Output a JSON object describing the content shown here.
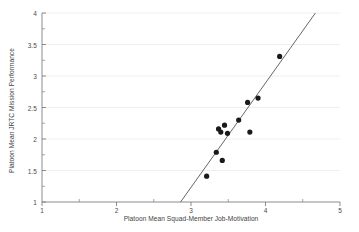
{
  "chart_data": {
    "type": "scatter",
    "title": "",
    "xlabel": "Platoon Mean Squad-Member Job-Motivation",
    "ylabel": "Platoon Mean JRTC Mission Performance",
    "xlim": [
      1,
      5
    ],
    "ylim": [
      1,
      4
    ],
    "xticks": [
      1,
      2,
      3,
      4,
      5
    ],
    "xtick_labels": [
      "1",
      "2",
      "3",
      "4",
      "5"
    ],
    "yticks": [
      1,
      1.5,
      2,
      2.5,
      3,
      3.5,
      4
    ],
    "ytick_labels": [
      "1",
      "1.5",
      "2",
      "2.5",
      "3",
      "3.5",
      "4"
    ],
    "x_minor_ticks": [
      1.5,
      2.5,
      3.5,
      4.5
    ],
    "y_minor_ticks": [
      1.25,
      1.75,
      2.25,
      2.75,
      3.25,
      3.75
    ],
    "grid": "horizontal-major-faint",
    "legend": null,
    "marker": "filled-circle",
    "marker_color": "#1a1a1a",
    "marker_size": 3.4,
    "line_color": "#555555",
    "axis_color": "#808080",
    "grid_color": "#e8e8e8",
    "points": [
      {
        "x": 3.21,
        "y": 1.41
      },
      {
        "x": 3.34,
        "y": 1.79
      },
      {
        "x": 3.42,
        "y": 1.66
      },
      {
        "x": 3.37,
        "y": 2.16
      },
      {
        "x": 3.45,
        "y": 2.22
      },
      {
        "x": 3.4,
        "y": 2.11
      },
      {
        "x": 3.49,
        "y": 2.09
      },
      {
        "x": 3.64,
        "y": 2.3
      },
      {
        "x": 3.76,
        "y": 2.58
      },
      {
        "x": 3.79,
        "y": 2.11
      },
      {
        "x": 3.9,
        "y": 2.65
      },
      {
        "x": 4.19,
        "y": 3.31
      }
    ],
    "fit_line": {
      "type": "linear-regression",
      "x_start": 2.86,
      "y_start": 1.0,
      "x_end": 4.67,
      "y_end": 4.0
    }
  }
}
